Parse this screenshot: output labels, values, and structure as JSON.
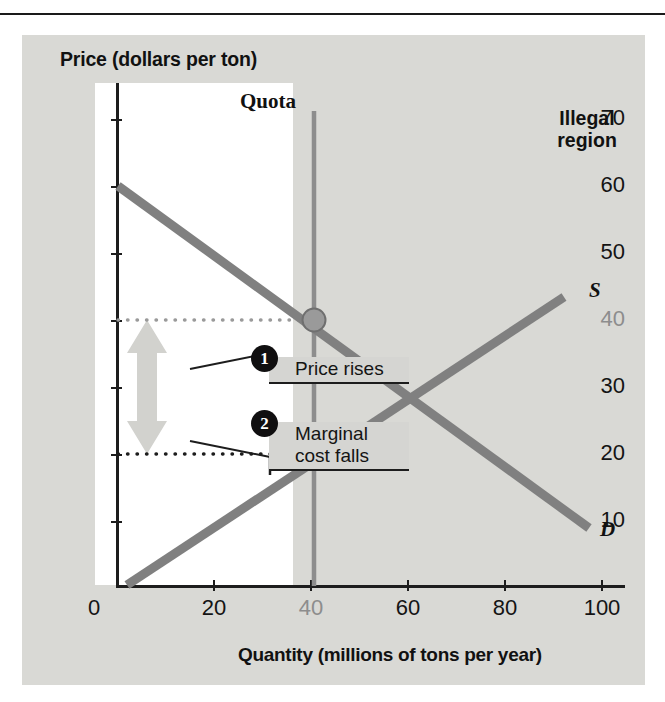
{
  "chart_data": {
    "type": "line",
    "title": "",
    "xlabel": "Quantity (millions of tons per year)",
    "ylabel": "Price (dollars per ton)",
    "xlim": [
      0,
      105
    ],
    "ylim": [
      0,
      74
    ],
    "xticks": [
      "0",
      "20",
      "40",
      "60",
      "80",
      "100"
    ],
    "xtick_values": [
      0,
      20,
      40,
      60,
      80,
      100
    ],
    "yticks": [
      "10",
      "20",
      "30",
      "40",
      "50",
      "60",
      "70"
    ],
    "ytick_values": [
      10,
      20,
      30,
      40,
      50,
      60,
      70
    ],
    "grid": false,
    "series": [
      {
        "name": "D",
        "label": "D",
        "type": "line",
        "color": "#808080",
        "points": [
          [
            0,
            60
          ],
          [
            97,
            9
          ]
        ]
      },
      {
        "name": "S",
        "label": "S",
        "type": "line",
        "color": "#808080",
        "points": [
          [
            2,
            0
          ],
          [
            92,
            43
          ]
        ]
      }
    ],
    "markers": [
      {
        "name": "quota-price-point",
        "x": 40,
        "y": 40,
        "fill": "#9a9a9a",
        "edge": "#6f6f6f"
      },
      {
        "name": "quota-marginal-cost-point",
        "x": 40,
        "y": 20,
        "fill": "#100f10",
        "edge": "#100f10"
      }
    ],
    "reference_lines": [
      {
        "name": "quota-line",
        "orientation": "vertical",
        "x": 40,
        "color": "#8d8d8d",
        "style": "solid",
        "label": "Quota"
      },
      {
        "name": "price-dotted",
        "orientation": "horizontal",
        "y": 40,
        "color": "#8d8d8d",
        "style": "dotted"
      },
      {
        "name": "marginal-cost-dotted",
        "orientation": "horizontal",
        "y": 20,
        "color": "#1d1d1d",
        "style": "dotted"
      }
    ],
    "regions": [
      {
        "name": "illegal-region",
        "label": "Illegal\nregion",
        "x_from": 40,
        "x_to": 105,
        "fill": "#d9d9d5"
      }
    ],
    "arrows": [
      {
        "name": "price-rises-arrow",
        "direction": "up",
        "x": 10,
        "y_from": 30,
        "y_to": 40,
        "color": "#d2d2ce"
      },
      {
        "name": "marginal-cost-falls-arrow",
        "direction": "down",
        "x": 10,
        "y_from": 30,
        "y_to": 20,
        "color": "#d2d2ce"
      }
    ],
    "annotations": [
      {
        "number": "1",
        "text": "Price rises"
      },
      {
        "number": "2",
        "text": "Marginal\ncost falls"
      }
    ]
  },
  "labels": {
    "y_axis_title": "Price (dollars per ton)",
    "x_axis_title": "Quantity (millions of tons per year)",
    "quota": "Quota",
    "illegal_region": "Illegal\nregion",
    "supply": "S",
    "demand": "D"
  },
  "y_ticks": [
    {
      "text": "70",
      "muted": false
    },
    {
      "text": "60",
      "muted": false
    },
    {
      "text": "50",
      "muted": false
    },
    {
      "text": "40",
      "muted": true
    },
    {
      "text": "30",
      "muted": false
    },
    {
      "text": "20",
      "muted": false
    },
    {
      "text": "10",
      "muted": false
    },
    {
      "text": "0",
      "muted": false
    }
  ],
  "x_ticks": [
    {
      "text": "0",
      "muted": false
    },
    {
      "text": "20",
      "muted": false
    },
    {
      "text": "40",
      "muted": true
    },
    {
      "text": "60",
      "muted": false
    },
    {
      "text": "80",
      "muted": false
    },
    {
      "text": "100",
      "muted": false
    }
  ],
  "callouts": [
    {
      "badge": "1",
      "text": "Price rises"
    },
    {
      "badge": "2",
      "text": "Marginal\ncost falls"
    }
  ],
  "colors": {
    "panel": "#d9d9d5",
    "plot_white": "#ffffff",
    "curve": "#808080",
    "quota_line": "#8d8d8d",
    "axis": "#1d1d1d",
    "arrow": "#d2d2ce",
    "badge": "#100f10",
    "callout_box": "#d5d5d2"
  }
}
